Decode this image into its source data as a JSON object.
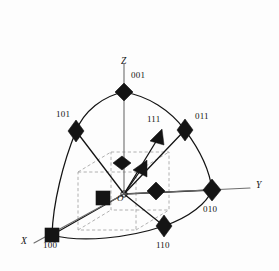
{
  "figure": {
    "type": "crystallographic-direction-diagram",
    "background_color": "#fdfdfd",
    "line_color": "#141414",
    "marker_color": "#141414",
    "dashed_color": "#9a9a9a",
    "axis_color": "#6e6e6e"
  },
  "axes": [
    {
      "name": "x-axis",
      "label": "X",
      "label_x": 22,
      "label_y": 238,
      "style": "italic"
    },
    {
      "name": "y-axis",
      "label": "Y",
      "label_x": 256,
      "label_y": 185,
      "style": "italic"
    },
    {
      "name": "z-axis",
      "label": "Z",
      "label_x": 121,
      "label_y": 57,
      "style": "italic"
    }
  ],
  "origin": {
    "label": "O",
    "label_x": 117,
    "label_y": 196,
    "cx": 124,
    "cy": 194
  },
  "markers": [
    {
      "name": "marker-001",
      "index": "001",
      "shape": "diamond",
      "cx": 124,
      "cy": 92,
      "label_x": 131,
      "label_y": 73
    },
    {
      "name": "marker-101",
      "index": "101",
      "shape": "diamond",
      "cx": 76,
      "cy": 131,
      "label_x": 56,
      "label_y": 112
    },
    {
      "name": "marker-011",
      "index": "011",
      "shape": "diamond",
      "cx": 185,
      "cy": 130,
      "label_x": 194,
      "label_y": 114
    },
    {
      "name": "marker-010",
      "index": "010",
      "shape": "diamond",
      "cx": 212,
      "cy": 190,
      "label_x": 203,
      "label_y": 208
    },
    {
      "name": "marker-110",
      "index": "110",
      "shape": "diamond",
      "cx": 164,
      "cy": 226,
      "label_x": 156,
      "label_y": 243
    },
    {
      "name": "marker-100",
      "index": "100",
      "shape": "square",
      "cx": 52,
      "cy": 235,
      "label_x": 44,
      "label_y": 243
    },
    {
      "name": "marker-111",
      "index": "111",
      "shape": "arrowhead",
      "cx": 157,
      "cy": 139,
      "label_x": 147,
      "label_y": 117
    },
    {
      "name": "marker-inner-arrow",
      "index": "",
      "shape": "arrowhead",
      "cx": 140,
      "cy": 171,
      "label_x": 0,
      "label_y": 0
    },
    {
      "name": "marker-inner-001",
      "index": "",
      "shape": "diamond",
      "cx": 122,
      "cy": 163,
      "label_x": 0,
      "label_y": 0
    },
    {
      "name": "marker-inner-010",
      "index": "",
      "shape": "diamond",
      "cx": 156,
      "cy": 191,
      "label_x": 0,
      "label_y": 0
    },
    {
      "name": "marker-inner-100",
      "index": "",
      "shape": "square",
      "cx": 103,
      "cy": 198,
      "label_x": 0,
      "label_y": 0
    }
  ],
  "labels": {
    "axis_x": "X",
    "axis_y": "Y",
    "axis_z": "Z",
    "origin": "O",
    "index_001": "001",
    "index_101": "101",
    "index_011": "011",
    "index_111": "111",
    "index_010": "010",
    "index_110": "110",
    "index_100": "100"
  }
}
